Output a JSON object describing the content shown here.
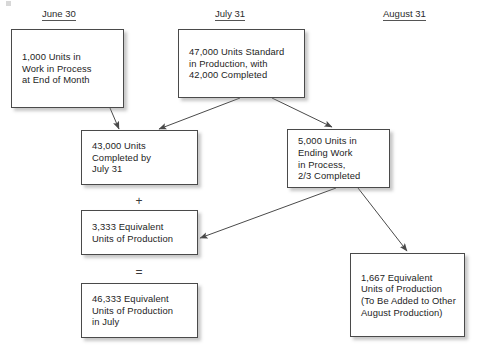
{
  "diagram": {
    "headers": [
      {
        "label": "June 30",
        "x": 42,
        "y": 8
      },
      {
        "label": "July 31",
        "x": 215,
        "y": 8
      },
      {
        "label": "August 31",
        "x": 383,
        "y": 8
      }
    ],
    "boxes": [
      {
        "id": "beginning-wip",
        "text": "1,000 Units in\nWork in Process\nat End of Month",
        "x": 11,
        "y": 29,
        "w": 113,
        "h": 79
      },
      {
        "id": "standard-production",
        "text": "47,000 Units Standard\nin Production, with\n42,000 Completed",
        "x": 178,
        "y": 29,
        "w": 127,
        "h": 69
      },
      {
        "id": "units-completed",
        "text": "43,000 Units\nCompleted by\nJuly 31",
        "x": 81,
        "y": 130,
        "w": 117,
        "h": 55
      },
      {
        "id": "ending-wip",
        "text": "5,000 Units in\nEnding Work\nin Process,\n2/3 Completed",
        "x": 287,
        "y": 129,
        "w": 103,
        "h": 59
      },
      {
        "id": "equivalent-units-3333",
        "text": "3,333 Equivalent\nUnits of Production",
        "x": 81,
        "y": 210,
        "w": 117,
        "h": 45
      },
      {
        "id": "equivalent-units-july-total",
        "text": "46,333 Equivalent\nUnits of Production\nin July",
        "x": 81,
        "y": 283,
        "w": 117,
        "h": 55
      },
      {
        "id": "equivalent-units-1667",
        "text": "1,667 Equivalent\nUnits of Production\n(To Be Added to Other\nAugust Production)",
        "x": 350,
        "y": 253,
        "w": 115,
        "h": 84
      }
    ],
    "operators": [
      {
        "id": "plus",
        "symbol": "+",
        "x": 132,
        "y": 195
      },
      {
        "id": "equals",
        "symbol": "=",
        "x": 132,
        "y": 266
      }
    ],
    "arrows": [
      {
        "id": "beginning-wip-to-units-completed",
        "x1": 110,
        "y1": 108,
        "x2": 119,
        "y2": 129
      },
      {
        "id": "standard-production-to-units-completed",
        "x1": 240,
        "y1": 98,
        "x2": 159,
        "y2": 129
      },
      {
        "id": "standard-production-to-ending-wip",
        "x1": 272,
        "y1": 98,
        "x2": 332,
        "y2": 127
      },
      {
        "id": "ending-wip-to-equivalent-units-3333",
        "x1": 336,
        "y1": 188,
        "x2": 200,
        "y2": 238
      },
      {
        "id": "ending-wip-to-equivalent-units-1667",
        "x1": 358,
        "y1": 188,
        "x2": 407,
        "y2": 251
      }
    ],
    "colors": {
      "line": "#4a4a4a",
      "text": "#1d1d1d",
      "background": "#ffffff",
      "shadow": "rgba(130,130,130,0.45)"
    }
  }
}
